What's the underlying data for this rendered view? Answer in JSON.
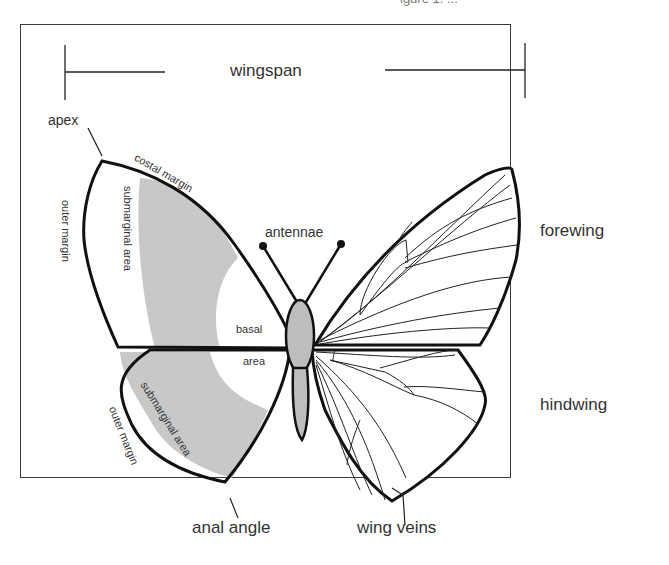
{
  "figure": {
    "title_fragment": "igure 1: ...",
    "labels": {
      "wingspan": "wingspan",
      "apex": "apex",
      "costal_margin": "costal margin",
      "outer_margin_fore": "outer margin",
      "submarginal_area_fore": "submarginal area",
      "antennae": "antennae",
      "forewing": "forewing",
      "basal": "basal",
      "area": "area",
      "hindwing": "hindwing",
      "submarginal_area_hind": "submarginal area",
      "outer_margin_hind": "outer margin",
      "anal_angle": "anal angle",
      "wing_veins": "wing veins"
    },
    "colors": {
      "outline": "#111111",
      "shading": "#c8c8c8",
      "body": "#bdbdbd",
      "text": "#333333",
      "frame": "#3a3a3a"
    }
  }
}
